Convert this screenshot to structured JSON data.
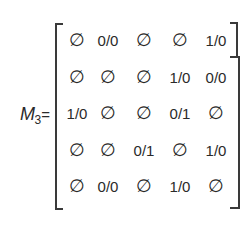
{
  "matrix": {
    "name": "M",
    "subscript": "3",
    "equals": "=",
    "rows": [
      [
        "∅",
        "0/0",
        "∅",
        "∅",
        "1/0"
      ],
      [
        "∅",
        "∅",
        "∅",
        "1/0",
        "0/0"
      ],
      [
        "1/0",
        "∅",
        "∅",
        "0/1",
        "∅"
      ],
      [
        "∅",
        "∅",
        "0/1",
        "∅",
        "1/0"
      ],
      [
        "∅",
        "0/0",
        "∅",
        "1/0",
        "∅"
      ]
    ]
  }
}
